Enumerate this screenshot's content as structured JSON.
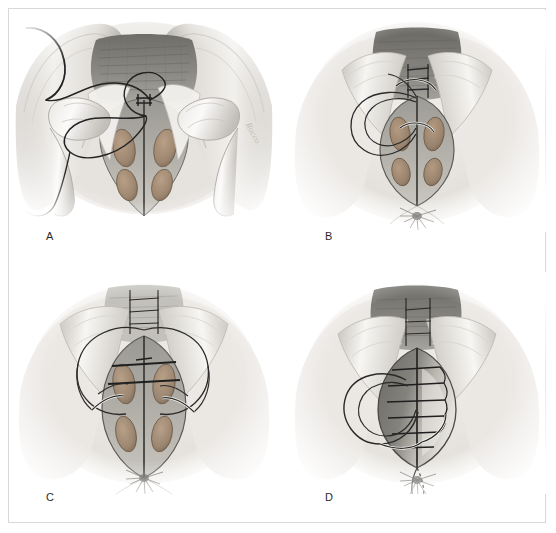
{
  "figure": {
    "kind": "medical-surgical-illustration",
    "technique": "Perineorrhaphy / posterior vaginal repair",
    "style": "graphite pencil and wash, grayscale with tan muscle tones",
    "panel_count": 4,
    "background_color": "#ffffff",
    "border_color": "#d8d8d8",
    "ink_color": "#232323",
    "muscle_color": "#a08b76",
    "tissue_color": "#8d8d88",
    "highlight_color": "#f4f2ee"
  },
  "panels": [
    {
      "id": "A",
      "label": "A",
      "caption_letter": "A",
      "view": "Perineal view with gloved fingers retracting the introitus",
      "elements": [
        "surgeon fingers retracting labia",
        "exposed rectovaginal septum",
        "curved suture needle with long thread at upper left",
        "thread loop crossing the midline",
        "diamond-shaped perineal defect",
        "four exposed muscle bundles"
      ],
      "signature": "Rocco"
    },
    {
      "id": "B",
      "label": "B",
      "caption_letter": "B",
      "view": "Perineal body with vertical incision and first suture placed",
      "elements": [
        "vaginal introitus with apex suture",
        "open lens-shaped incision",
        "four exposed muscle bundles",
        "large oval suture thread loop to the left",
        "needle passing through apex",
        "anus below with radiating folds"
      ],
      "signature": "Rocco"
    },
    {
      "id": "C",
      "label": "C",
      "caption_letter": "C",
      "view": "Deep muscle approximation sutures being placed",
      "elements": [
        "wide suture loop encircling the introitus",
        "transverse deep sutures through upper muscle pair",
        "two needles entering bilateral muscle bundles",
        "four exposed muscle bundles",
        "anus below with radiating folds"
      ],
      "signature": ""
    },
    {
      "id": "D",
      "label": "D",
      "caption_letter": "D",
      "view": "Completed closure with running suture line",
      "elements": [
        "approximated midline with running sutures",
        "six horizontal suture bars across the closure",
        "oval thread loop to the left",
        "dotted suture tail extending toward the anus",
        "anus below with radiating folds"
      ],
      "signature": ""
    }
  ],
  "labels": {
    "a": "A",
    "b": "B",
    "c": "C",
    "d": "D"
  },
  "signatures": {
    "panel_a": "Rocco",
    "panel_b": "Rocco"
  }
}
